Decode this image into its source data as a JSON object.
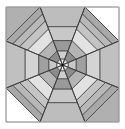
{
  "diagram": {
    "title": "",
    "canvas": {
      "width": 125,
      "height": 129
    },
    "square": {
      "x": 6,
      "y": 7,
      "w": 113,
      "h": 115
    },
    "center": [
      62.5,
      65
    ],
    "corner_fills": {
      "top_left": "#b0b0b0",
      "top_right": "#ffffff",
      "bottom_right": "#b0b0b0",
      "bottom_left": "#ffffff"
    },
    "stroke_color": "#3a3a3a",
    "octagon": [
      [
        40,
        7
      ],
      [
        85,
        7
      ],
      [
        119,
        41
      ],
      [
        119,
        88
      ],
      [
        85,
        122
      ],
      [
        40,
        122
      ],
      [
        6,
        88
      ],
      [
        6,
        41
      ]
    ],
    "sectors": [
      {
        "name": "top",
        "edge": [
          0,
          1
        ],
        "scales": [
          1.0,
          0.66,
          0.42,
          0.24,
          0.1
        ],
        "fills": [
          "#bdbdbd",
          "#c8c8c8",
          "#9a9a9a",
          "#cfcfcf",
          "#eeeeee"
        ]
      },
      {
        "name": "top-right",
        "edge": [
          1,
          2
        ],
        "scales": [
          1.0,
          0.88,
          0.76,
          0.62,
          0.42,
          0.24,
          0.1
        ],
        "fills": [
          "#a8a8a8",
          "#b8b8b8",
          "#c4c4c4",
          "#e2e2e2",
          "#b4b4b4",
          "#8c8c8c",
          "#dddddd"
        ]
      },
      {
        "name": "right",
        "edge": [
          2,
          3
        ],
        "scales": [
          1.0,
          0.66,
          0.42,
          0.24,
          0.1
        ],
        "fills": [
          "#c0c0c0",
          "#d4d4d4",
          "#a0a0a0",
          "#c8c8c8",
          "#efefef"
        ]
      },
      {
        "name": "bottom-right",
        "edge": [
          3,
          4
        ],
        "scales": [
          1.0,
          0.88,
          0.76,
          0.62,
          0.42,
          0.24,
          0.1
        ],
        "fills": [
          "#a8a8a8",
          "#b8b8b8",
          "#c4c4c4",
          "#e2e2e2",
          "#b4b4b4",
          "#8c8c8c",
          "#dddddd"
        ]
      },
      {
        "name": "bottom",
        "edge": [
          4,
          5
        ],
        "scales": [
          1.0,
          0.66,
          0.42,
          0.24,
          0.1
        ],
        "fills": [
          "#bdbdbd",
          "#c8c8c8",
          "#9a9a9a",
          "#cfcfcf",
          "#eeeeee"
        ]
      },
      {
        "name": "bottom-left",
        "edge": [
          5,
          6
        ],
        "scales": [
          1.0,
          0.88,
          0.76,
          0.62,
          0.42,
          0.24,
          0.1
        ],
        "fills": [
          "#a8a8a8",
          "#b8b8b8",
          "#c4c4c4",
          "#e2e2e2",
          "#b4b4b4",
          "#8c8c8c",
          "#dddddd"
        ]
      },
      {
        "name": "left",
        "edge": [
          6,
          7
        ],
        "scales": [
          1.0,
          0.66,
          0.42,
          0.24,
          0.1
        ],
        "fills": [
          "#c0c0c0",
          "#d4d4d4",
          "#a0a0a0",
          "#c8c8c8",
          "#efefef"
        ]
      },
      {
        "name": "top-left",
        "edge": [
          7,
          0
        ],
        "scales": [
          1.0,
          0.88,
          0.76,
          0.62,
          0.42,
          0.24,
          0.1
        ],
        "fills": [
          "#a8a8a8",
          "#b8b8b8",
          "#c4c4c4",
          "#e2e2e2",
          "#b4b4b4",
          "#8c8c8c",
          "#dddddd"
        ]
      }
    ]
  }
}
